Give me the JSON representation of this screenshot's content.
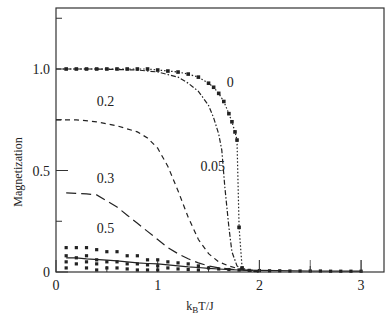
{
  "chart_data": {
    "type": "line",
    "title": "",
    "xlabel": "k_B T/J",
    "xlabel_main": "k",
    "xlabel_sub": "B",
    "xlabel_rest": "T/J",
    "ylabel": "Magnetization",
    "xlim": [
      0,
      3.2
    ],
    "ylim": [
      0,
      1.3
    ],
    "grid": false,
    "legend": "inline curve labels",
    "x_ticks": [
      0,
      1,
      2,
      3
    ],
    "x_tick_labels": [
      "0",
      "1",
      "2",
      "3"
    ],
    "y_ticks": [
      0,
      0.5,
      1.0
    ],
    "y_tick_labels": [
      "0",
      "0.5",
      "1.0"
    ],
    "y_minor_ticks": [
      0.25,
      0.75,
      1.25
    ],
    "series": [
      {
        "name": "0",
        "style": "dotted-markers",
        "x": [
          0.1,
          0.2,
          0.3,
          0.4,
          0.5,
          0.6,
          0.7,
          0.8,
          0.9,
          1.0,
          1.1,
          1.2,
          1.3,
          1.4,
          1.5,
          1.55,
          1.6,
          1.65,
          1.7,
          1.73,
          1.76,
          1.78,
          1.8,
          1.83,
          1.9,
          2.0
        ],
        "y": [
          1.0,
          1.0,
          1.0,
          1.0,
          1.0,
          1.0,
          1.0,
          1.0,
          1.0,
          0.995,
          0.99,
          0.985,
          0.975,
          0.96,
          0.93,
          0.91,
          0.88,
          0.84,
          0.78,
          0.74,
          0.69,
          0.65,
          0.22,
          0.02,
          0.005,
          0.0
        ]
      },
      {
        "name": "0.05",
        "style": "dash-dot",
        "x": [
          0.0,
          0.4,
          0.8,
          1.0,
          1.2,
          1.3,
          1.4,
          1.5,
          1.55,
          1.6,
          1.63,
          1.66,
          1.7,
          1.73,
          1.78,
          1.85,
          2.0
        ],
        "y": [
          1.0,
          1.0,
          0.995,
          0.985,
          0.96,
          0.93,
          0.89,
          0.82,
          0.76,
          0.68,
          0.6,
          0.42,
          0.22,
          0.1,
          0.03,
          0.01,
          0.0
        ]
      },
      {
        "name": "0.2",
        "style": "dashed",
        "x": [
          0.0,
          0.2,
          0.4,
          0.6,
          0.8,
          0.9,
          1.0,
          1.1,
          1.2,
          1.3,
          1.4,
          1.5,
          1.6,
          1.7,
          1.8,
          2.0
        ],
        "y": [
          0.75,
          0.75,
          0.74,
          0.72,
          0.69,
          0.66,
          0.61,
          0.52,
          0.4,
          0.27,
          0.16,
          0.09,
          0.05,
          0.03,
          0.015,
          0.005
        ]
      },
      {
        "name": "0.3",
        "style": "long-dash",
        "x": [
          0.1,
          0.3,
          0.4,
          0.5,
          0.6,
          0.7,
          0.8,
          0.9,
          1.0,
          1.1,
          1.2,
          1.3,
          1.4,
          1.5,
          1.6,
          1.8,
          2.0
        ],
        "y": [
          0.39,
          0.385,
          0.38,
          0.35,
          0.32,
          0.28,
          0.24,
          0.2,
          0.16,
          0.12,
          0.09,
          0.065,
          0.045,
          0.03,
          0.02,
          0.01,
          0.005
        ]
      },
      {
        "name": "0.5",
        "style": "solid",
        "x": [
          0.1,
          0.2,
          0.3,
          0.5,
          0.6,
          0.7,
          0.8,
          0.9,
          1.0,
          1.1,
          1.2,
          1.3,
          1.4,
          1.5,
          1.6,
          1.7,
          1.8,
          2.0,
          2.5,
          3.0
        ],
        "y": [
          0.07,
          0.07,
          0.065,
          0.058,
          0.055,
          0.05,
          0.045,
          0.042,
          0.04,
          0.035,
          0.03,
          0.025,
          0.022,
          0.018,
          0.015,
          0.012,
          0.01,
          0.008,
          0.005,
          0.004
        ]
      }
    ],
    "scatter_markers": {
      "name": "0.5 samples",
      "x": [
        0.1,
        0.1,
        0.1,
        0.1,
        0.2,
        0.2,
        0.2,
        0.3,
        0.3,
        0.3,
        0.3,
        0.4,
        0.4,
        0.4,
        0.4,
        0.5,
        0.5,
        0.5,
        0.6,
        0.6,
        0.6,
        0.7,
        0.7,
        0.7,
        0.8,
        0.8,
        0.8,
        0.9,
        0.9,
        0.9,
        1.0,
        1.0,
        1.0,
        1.1,
        1.1,
        1.2,
        1.2,
        1.3,
        1.3,
        1.4,
        1.4,
        1.5,
        1.6,
        1.7,
        1.8,
        1.9,
        2.0,
        2.1,
        2.2,
        2.3,
        2.4,
        2.5,
        2.6,
        2.7,
        2.8,
        2.9,
        3.0
      ],
      "y": [
        0.12,
        0.08,
        0.05,
        0.02,
        0.12,
        0.07,
        0.04,
        0.12,
        0.08,
        0.05,
        0.02,
        0.11,
        0.06,
        0.04,
        0.01,
        0.1,
        0.05,
        0.02,
        0.1,
        0.05,
        0.02,
        0.08,
        0.04,
        0.015,
        0.08,
        0.04,
        0.01,
        0.06,
        0.035,
        0.01,
        0.06,
        0.03,
        0.01,
        0.05,
        0.02,
        0.045,
        0.015,
        0.04,
        0.012,
        0.03,
        0.01,
        0.02,
        0.015,
        0.012,
        0.01,
        0.008,
        0.007,
        0.006,
        0.006,
        0.005,
        0.005,
        0.005,
        0.005,
        0.004,
        0.004,
        0.004,
        0.004
      ]
    },
    "annotations": [
      {
        "text": "0",
        "x": 1.68,
        "y": 0.91
      },
      {
        "text": "0.2",
        "x": 0.4,
        "y": 0.82
      },
      {
        "text": "0.05",
        "x": 1.42,
        "y": 0.5
      },
      {
        "text": "0.3",
        "x": 0.4,
        "y": 0.44
      },
      {
        "text": "0.5",
        "x": 0.4,
        "y": 0.19
      }
    ]
  }
}
